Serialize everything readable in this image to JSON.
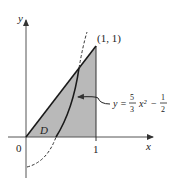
{
  "figure": {
    "axes": {
      "x_label": "x",
      "y_label": "y",
      "origin_label": "0",
      "x_tick_label": "1"
    },
    "point_label": "(1, 1)",
    "region_label": "D",
    "curve_equation": {
      "lhs": "y =",
      "frac1_num": "5",
      "frac1_den": "3",
      "term": "x²",
      "minus": "−",
      "frac2_num": "1",
      "frac2_den": "2"
    },
    "colors": {
      "shade": "#b8b8b8",
      "stroke": "#1a1a1a",
      "axis": "#555555"
    }
  }
}
